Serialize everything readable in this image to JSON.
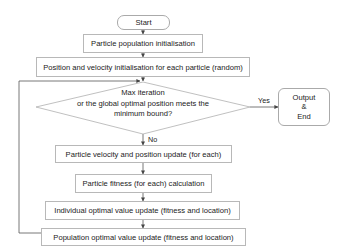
{
  "flowchart": {
    "start": "Start",
    "step1": "Particle population initialisation",
    "step2": "Position and velocity initialisation for each particle (random)",
    "decision": {
      "line1": "Max iteration",
      "line2": "or the global optimal position meets the",
      "line3": "minimum bound?"
    },
    "yes_label": "Yes",
    "no_label": "No",
    "end": {
      "line1": "Output",
      "line2": "&",
      "line3": "End"
    },
    "step3": "Particle velocity and position update (for each)",
    "step4": "Particle fitness (for each) calculation",
    "step5": "Individual optimal value update (fitness and location)",
    "step6": "Population optimal value update (fitness and location)"
  },
  "colors": {
    "line": "#555555",
    "border": "#b8b8b8",
    "text": "#222222"
  }
}
